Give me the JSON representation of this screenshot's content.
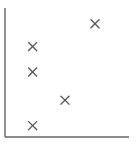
{
  "chart_data": {
    "type": "scatter",
    "title": "",
    "xlabel": "",
    "ylabel": "",
    "grid": false,
    "legend": null,
    "marker": "x",
    "marker_color": "#555555",
    "axis_color": "#666666",
    "xlim": [
      0,
      10
    ],
    "ylim": [
      0,
      10
    ],
    "x_ticks": [],
    "y_ticks": [],
    "series": [
      {
        "name": "points",
        "points": [
          {
            "x": 7.5,
            "y": 8.3
          },
          {
            "x": 2.3,
            "y": 6.6
          },
          {
            "x": 2.3,
            "y": 4.7
          },
          {
            "x": 5.0,
            "y": 2.6
          },
          {
            "x": 2.3,
            "y": 0.7
          }
        ]
      }
    ]
  }
}
